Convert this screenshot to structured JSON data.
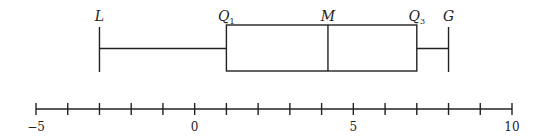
{
  "chart_data": {
    "type": "boxplot",
    "title": "",
    "xlabel": "",
    "ylabel": "",
    "xlim": [
      -5,
      10
    ],
    "axis": {
      "min": -5,
      "max": 10,
      "tick_step": 1,
      "labeled_ticks": [
        {
          "value": -5,
          "label": "−5"
        },
        {
          "value": 0,
          "label": "0"
        },
        {
          "value": 5,
          "label": "5"
        },
        {
          "value": 10,
          "label": "10"
        }
      ]
    },
    "box": {
      "L": -3,
      "Q1": 1,
      "M": 4.2,
      "Q3": 7,
      "G": 8
    },
    "annotations": [
      {
        "key": "L",
        "text": "L",
        "subscript": ""
      },
      {
        "key": "Q1",
        "text": "Q",
        "subscript": "1"
      },
      {
        "key": "M",
        "text": "M",
        "subscript": ""
      },
      {
        "key": "Q3",
        "text": "Q",
        "subscript": "3"
      },
      {
        "key": "G",
        "text": "G",
        "subscript": ""
      }
    ],
    "grid": false,
    "legend": "none"
  },
  "colors": {
    "line": "#222222",
    "background": "#ffffff"
  }
}
